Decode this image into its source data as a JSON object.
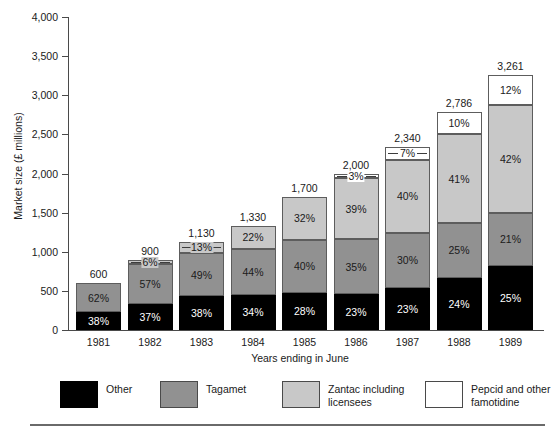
{
  "axes": {
    "y_title": "Market size (£ millions)",
    "x_title": "Years ending in June",
    "y_ticks": [
      "0",
      "500",
      "1,000",
      "1,500",
      "2,000",
      "2,500",
      "3,000",
      "3,500",
      "4,000"
    ]
  },
  "legend": {
    "items": [
      {
        "label": "Other",
        "color": "#000000",
        "name": "legend-item-other"
      },
      {
        "label": "Tagamet",
        "color": "#919191",
        "name": "legend-item-tagamet"
      },
      {
        "label": "Zantac including licensees",
        "color": "#c8c8c8",
        "name": "legend-item-zantac"
      },
      {
        "label": "Pepcid and other famotidine",
        "color": "#ffffff",
        "name": "legend-item-pepcid"
      }
    ]
  },
  "colors": {
    "other": "#000000",
    "tagamet": "#919191",
    "zantac": "#c8c8c8",
    "pepcid": "#ffffff",
    "axis": "#4a4a4a",
    "text": "#1a1a1a"
  },
  "totals": {
    "1981": "600",
    "1982": "900",
    "1983": "1,130",
    "1984": "1,330",
    "1985": "1,700",
    "1986": "2,000",
    "1987": "2,340",
    "1988": "2,786",
    "1989": "3,261"
  },
  "chart_data": {
    "type": "bar",
    "subtype": "stacked-bar-100-percent-labeled",
    "title": "",
    "xlabel": "Years ending in June",
    "ylabel": "Market size (£ millions)",
    "ylim": [
      0,
      4000
    ],
    "ytick_step": 500,
    "grid": false,
    "legend_position": "bottom",
    "categories": [
      "1981",
      "1982",
      "1983",
      "1984",
      "1985",
      "1986",
      "1987",
      "1988",
      "1989"
    ],
    "totals": [
      600,
      900,
      1130,
      1330,
      1700,
      2000,
      2340,
      2786,
      3261
    ],
    "series": [
      {
        "name": "Other",
        "color": "#000000",
        "percent": [
          38,
          37,
          38,
          34,
          28,
          23,
          23,
          24,
          25
        ],
        "percent_labels": [
          "38%",
          "37%",
          "38%",
          "34%",
          "28%",
          "23%",
          "23%",
          "24%",
          "25%"
        ]
      },
      {
        "name": "Tagamet",
        "color": "#919191",
        "percent": [
          62,
          57,
          49,
          44,
          40,
          35,
          30,
          25,
          21
        ],
        "percent_labels": [
          "62%",
          "57%",
          "49%",
          "44%",
          "40%",
          "35%",
          "30%",
          "25%",
          "21%"
        ]
      },
      {
        "name": "Zantac including licensees",
        "color": "#c8c8c8",
        "percent": [
          0,
          6,
          13,
          22,
          32,
          39,
          40,
          41,
          42
        ],
        "percent_labels": [
          "",
          "6%",
          "13%",
          "22%",
          "32%",
          "39%",
          "40%",
          "41%",
          "42%"
        ]
      },
      {
        "name": "Pepcid and other famotidine",
        "color": "#ffffff",
        "percent": [
          0,
          0,
          0,
          0,
          0,
          3,
          7,
          10,
          12
        ],
        "percent_labels": [
          "",
          "",
          "",
          "",
          "",
          "3%",
          "7%",
          "10%",
          "12%"
        ]
      }
    ]
  }
}
